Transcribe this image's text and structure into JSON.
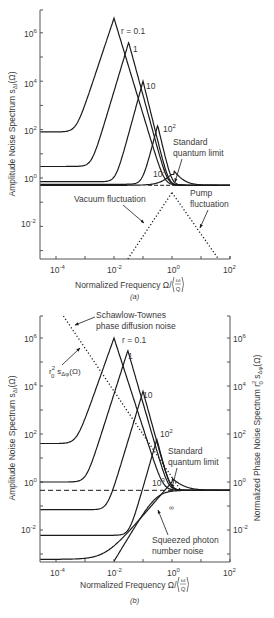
{
  "colors": {
    "ink": "#1a1a1a",
    "text": "#3a3a3a",
    "background": "#ffffff"
  },
  "chart_data": [
    {
      "panel": "a",
      "type": "line",
      "caption": "(a)",
      "xlabel": "Normalized Frequency Ω/(ω/Q)",
      "ylabel": "Amplitude Noise Spectrum s_ΔI(Ω)",
      "xscale": "log",
      "yscale": "log",
      "xlim": [
        3e-05,
        100
      ],
      "ylim": [
        0.0003,
        10000000
      ],
      "xticks": [
        "10^-4",
        "10^-2",
        "10^0",
        "10^2"
      ],
      "yticks": [
        "10^-2",
        "10^0",
        "10^2",
        "10^4",
        "10^6"
      ],
      "grid": false,
      "series": [
        {
          "name": "r = 0.1",
          "style": "solid",
          "floor": 80,
          "peak_x": 0.01,
          "peak_y": 4000000
        },
        {
          "name": "1",
          "style": "solid",
          "floor": 3,
          "peak_x": 0.032,
          "peak_y": 400000
        },
        {
          "name": "10",
          "style": "solid",
          "floor": 0.7,
          "peak_x": 0.1,
          "peak_y": 10000
        },
        {
          "name": "10^2",
          "style": "solid",
          "floor": 0.55,
          "peak_x": 0.32,
          "peak_y": 150
        },
        {
          "name": "10^3",
          "style": "solid",
          "floor": 0.5,
          "peak_x": 1.2,
          "peak_y": 1.4
        },
        {
          "name": "Standard quantum limit",
          "style": "dashed",
          "level": 0.5
        },
        {
          "name": "Vacuum fluctuation",
          "style": "dotted",
          "x": [
            0.03,
            1.0
          ],
          "y": [
            0.0003,
            0.25
          ]
        },
        {
          "name": "Pump fluctuation",
          "style": "dotted",
          "x": [
            1.0,
            40
          ],
          "y": [
            0.25,
            0.0003
          ]
        }
      ],
      "annotations": [
        "r = 0.1",
        "1",
        "10",
        "10^2",
        "10^3",
        "Standard quantum limit",
        "Vacuum fluctuation",
        "Pump fluctuation"
      ]
    },
    {
      "panel": "b",
      "type": "line",
      "caption": "(b)",
      "xlabel": "Normalized Frequency Ω/(ω/Q)",
      "ylabel": "Amplitude Noise Spectrum s_ΔI(Ω)",
      "ylabel_right": "Normalized Phase Noise Spectrum r0² s_Δφ(Ω)",
      "xscale": "log",
      "yscale": "log",
      "xlim": [
        3e-05,
        100
      ],
      "ylim": [
        0.0003,
        10000000
      ],
      "xticks": [
        "10^-4",
        "10^-2",
        "10^0",
        "10^2"
      ],
      "yticks": [
        "10^-2",
        "10^0",
        "10^2",
        "10^4",
        "10^6"
      ],
      "yticks_right": [
        "10^-2",
        "10^0",
        "10^2",
        "10^4",
        "10^6"
      ],
      "grid": false,
      "series": [
        {
          "name": "r = 0.1",
          "style": "solid",
          "floor": 40,
          "peak_x": 0.01,
          "peak_y": 1000000
        },
        {
          "name": "1",
          "style": "solid",
          "floor": 1,
          "peak_x": 0.03,
          "peak_y": 300000
        },
        {
          "name": "10",
          "style": "solid",
          "floor": 0.07,
          "peak_x": 0.1,
          "peak_y": 6000
        },
        {
          "name": "10^2",
          "style": "solid",
          "floor": 0.006,
          "peak_x": 0.3,
          "peak_y": 60
        },
        {
          "name": "10^3",
          "style": "solid",
          "floor": 0.0006,
          "peak_x": 1.0,
          "peak_y": 1.0
        },
        {
          "name": "∞",
          "style": "solid",
          "rising_from_x": 0.012
        },
        {
          "name": "Standard quantum limit",
          "style": "dashed",
          "level": 0.45
        },
        {
          "name": "Schawlow-Townes phase diffusion noise r0² s_Δφ(Ω)",
          "style": "dotted",
          "x": [
            0.00018,
            2.0
          ],
          "y": [
            30000000,
            0.45
          ]
        }
      ],
      "annotations": [
        "Schawlow-Townes phase diffusion noise",
        "r0² s_Δφ(Ω)",
        "r = 0.1",
        "1",
        "10",
        "10^2",
        "10^3",
        "∞",
        "Standard quantum limit",
        "Squeezed photon number noise"
      ]
    }
  ],
  "panel_a": {
    "caption": "(a)",
    "xlabel": "Normalized Frequency Ω/",
    "xlabel_frac_num": "ω",
    "xlabel_frac_den": "Q",
    "ylabel": "Amplitude Noise Spectrum s",
    "ylabel_sub": "ΔI",
    "ylabel_tail": "(Ω)",
    "xticks": [
      {
        "base": "10",
        "exp": "-4"
      },
      {
        "base": "10",
        "exp": "-2"
      },
      {
        "base": "10",
        "exp": "0"
      },
      {
        "base": "10",
        "exp": "2"
      }
    ],
    "yticks": [
      {
        "base": "10",
        "exp": "6"
      },
      {
        "base": "10",
        "exp": "4"
      },
      {
        "base": "10",
        "exp": "2"
      },
      {
        "base": "10",
        "exp": "0"
      },
      {
        "base": "10",
        "exp": "-2"
      }
    ],
    "labels": {
      "r01": "r = 0.1",
      "r1": "1",
      "r10": "10",
      "r100_base": "10",
      "r100_exp": "2",
      "r1000_base": "10",
      "r1000_exp": "3",
      "sql_line1": "Standard",
      "sql_line2": "quantum limit",
      "vacuum": "Vacuum fluctuation",
      "pump_line1": "Pump",
      "pump_line2": "fluctuation"
    }
  },
  "panel_b": {
    "caption": "(b)",
    "xlabel": "Normalized Frequency Ω/",
    "xlabel_frac_num": "ω",
    "xlabel_frac_den": "Q",
    "ylabel": "Amplitude Noise Spectrum s",
    "ylabel_sub": "ΔI",
    "ylabel_tail": "(Ω)",
    "ylabel_right": "Normalized Phase Noise Spectrum r",
    "ylabel_right_sup": "2",
    "ylabel_right_sub0": "0",
    "ylabel_right_tail": " s",
    "ylabel_right_sub": "Δφ",
    "ylabel_right_end": "(Ω)",
    "xticks": [
      {
        "base": "10",
        "exp": "-4"
      },
      {
        "base": "10",
        "exp": "-2"
      },
      {
        "base": "10",
        "exp": "0"
      },
      {
        "base": "10",
        "exp": "2"
      }
    ],
    "yticks": [
      {
        "base": "10",
        "exp": "6"
      },
      {
        "base": "10",
        "exp": "4"
      },
      {
        "base": "10",
        "exp": "2"
      },
      {
        "base": "10",
        "exp": "0"
      },
      {
        "base": "10",
        "exp": "-2"
      }
    ],
    "labels": {
      "st_line1": "Schawlow-Townes",
      "st_line2": "phase diffusion noise",
      "phase_r": "r",
      "phase_sup": "2",
      "phase_sub0": "0",
      "phase_s": "s",
      "phase_sub": "Δφ",
      "phase_tail": "(Ω)",
      "r01": "r = 0.1",
      "r1": "1",
      "r10": "10",
      "r100_base": "10",
      "r100_exp": "2",
      "r1000_base": "10",
      "r1000_exp": "3",
      "rinf": "∞",
      "sql_line1": "Standard",
      "sql_line2": "quantum limit",
      "sq_line1": "Squeezed photon",
      "sq_line2": "number noise"
    }
  }
}
